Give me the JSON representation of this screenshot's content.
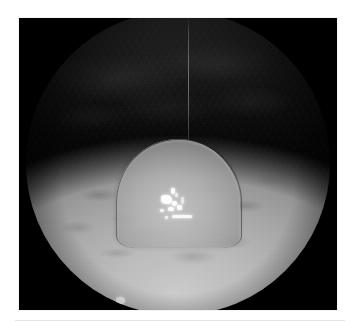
{
  "figure": {
    "kind": "endoscopic-photograph",
    "modality_label": "white-light endoscopy",
    "color_mode": "grayscale",
    "caption": "",
    "frame": {
      "left_px": 19,
      "top_px": 18,
      "width_px": 318,
      "height_px": 292,
      "background_hex": "#000000"
    },
    "field_of_view": {
      "shape": "circle",
      "diameter_px": 304,
      "letterbox_hex": "#000000"
    }
  },
  "regions": [
    {
      "name": "dark-cavity",
      "label": "Unilluminated far wall of the cavity",
      "position": "upper third",
      "mean_gray_hex": "#161616",
      "interactable": false
    },
    {
      "name": "mucosa-foreground",
      "label": "Illuminated mucosal surface",
      "position": "lower two thirds",
      "mean_gray_hex": "#a8a8a8",
      "interactable": false
    },
    {
      "name": "lesion-dome",
      "label": "Dome-shaped protruding lesion",
      "position": "center",
      "mean_gray_hex": "#b4b4b4",
      "contour_hex": "#1c1c1c",
      "interactable": false
    },
    {
      "name": "specular-cluster",
      "label": "Specular light reflection cluster",
      "position": "center, on lesion surface",
      "mean_gray_hex": "#ffffff",
      "interactable": false
    },
    {
      "name": "secondary-highlight",
      "label": "Secondary specular reflection",
      "position": "lower left",
      "mean_gray_hex": "#f7f7f7",
      "interactable": false
    },
    {
      "name": "instrument-line",
      "label": "Thin vertical scope artifact line",
      "position": "upper center",
      "mean_gray_hex": "#9a9a9a",
      "interactable": false
    }
  ],
  "page": {
    "background_hex": "#ffffff",
    "divider_hex": "#e4e4e4"
  }
}
